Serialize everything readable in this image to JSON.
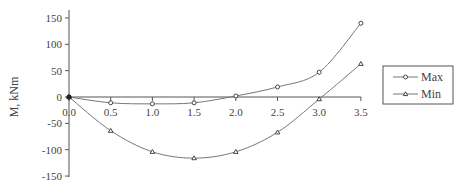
{
  "chart_data": {
    "type": "line",
    "title": "",
    "xlabel": "",
    "ylabel": "M, kNm",
    "x": [
      0.0,
      0.5,
      1.0,
      1.5,
      2.0,
      2.5,
      3.0,
      3.5
    ],
    "x_tick_labels": [
      "0.0",
      "0.5",
      "1.0",
      "1.5",
      "2.0",
      "2.5",
      "3.0",
      "3.5"
    ],
    "y_ticks": [
      150,
      100,
      50,
      0,
      -50,
      -100,
      -150
    ],
    "y_tick_labels": [
      "150",
      "100",
      "50",
      "0",
      "-50",
      "-100",
      "-150"
    ],
    "xlim": [
      0,
      3.5
    ],
    "ylim": [
      -150,
      160
    ],
    "grid": false,
    "legend_position": "right",
    "series": [
      {
        "name": "Max",
        "marker": "circle",
        "values": [
          0,
          -11,
          -13,
          -11,
          2,
          19,
          47,
          140
        ]
      },
      {
        "name": "Min",
        "marker": "triangle",
        "values": [
          0,
          -64,
          -104,
          -116,
          -104,
          -67,
          -4,
          63
        ]
      }
    ]
  },
  "legend": {
    "items": [
      "Max",
      "Min"
    ]
  }
}
